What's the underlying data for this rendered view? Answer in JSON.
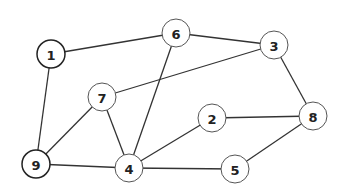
{
  "graph": {
    "node_radius": 14,
    "nodes": [
      {
        "id": "1",
        "label": "1",
        "x": 51,
        "y": 54,
        "strong": true
      },
      {
        "id": "2",
        "label": "2",
        "x": 212,
        "y": 118,
        "strong": false
      },
      {
        "id": "3",
        "label": "3",
        "x": 274,
        "y": 45,
        "strong": false
      },
      {
        "id": "4",
        "label": "4",
        "x": 129,
        "y": 168,
        "strong": false
      },
      {
        "id": "5",
        "label": "5",
        "x": 235,
        "y": 169,
        "strong": false
      },
      {
        "id": "6",
        "label": "6",
        "x": 176,
        "y": 33,
        "strong": false
      },
      {
        "id": "7",
        "label": "7",
        "x": 102,
        "y": 97,
        "strong": false
      },
      {
        "id": "8",
        "label": "8",
        "x": 313,
        "y": 116,
        "strong": false
      },
      {
        "id": "9",
        "label": "9",
        "x": 36,
        "y": 164,
        "strong": true
      }
    ],
    "edges": [
      [
        "1",
        "6"
      ],
      [
        "1",
        "9"
      ],
      [
        "6",
        "3"
      ],
      [
        "6",
        "4"
      ],
      [
        "3",
        "7"
      ],
      [
        "3",
        "8"
      ],
      [
        "7",
        "9"
      ],
      [
        "7",
        "4"
      ],
      [
        "9",
        "4"
      ],
      [
        "4",
        "2"
      ],
      [
        "4",
        "5"
      ],
      [
        "2",
        "8"
      ],
      [
        "8",
        "5"
      ]
    ]
  }
}
